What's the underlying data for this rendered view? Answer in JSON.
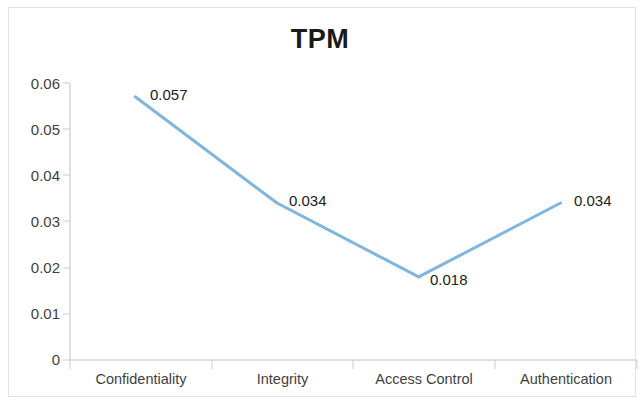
{
  "chart_data": {
    "type": "line",
    "title": "TPM",
    "xlabel": "",
    "ylabel": "",
    "categories": [
      "Confidentiality",
      "Integrity",
      "Access Control",
      "Authentication"
    ],
    "values": [
      0.057,
      0.034,
      0.018,
      0.034
    ],
    "point_labels": [
      "0.057",
      "0.034",
      "0.018",
      "0.034"
    ],
    "series": [
      {
        "name": "TPM",
        "values": [
          0.057,
          0.034,
          0.018,
          0.034
        ]
      }
    ],
    "ylim": [
      0,
      0.06
    ],
    "ytick_labels": [
      "0.06",
      "0.05",
      "0.04",
      "0.03",
      "0.02",
      "0.01",
      "0"
    ],
    "ytick_values": [
      0.06,
      0.05,
      0.04,
      0.03,
      0.02,
      0.01,
      0
    ],
    "grid": false,
    "legend": "none",
    "line_color": "#7EB6DE",
    "axis_color": "#d0d0d0",
    "text_color": "#3f3f3f",
    "background": "#ffffff"
  },
  "labels": {
    "y0": "0.06",
    "y1": "0.05",
    "y2": "0.04",
    "y3": "0.03",
    "y4": "0.02",
    "y5": "0.01",
    "y6": "0",
    "x0": "Confidentiality",
    "x1": "Integrity",
    "x2": "Access Control",
    "x3": "Authentication",
    "p0": "0.057",
    "p1": "0.034",
    "p2": "0.018",
    "p3": "0.034"
  }
}
